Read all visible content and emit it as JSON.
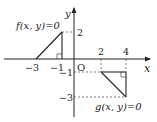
{
  "diagram": {
    "type": "coordinate-plane",
    "axes": {
      "x_label": "x",
      "y_label": "y",
      "origin_label": "O"
    },
    "x_ticks": [
      {
        "value": -3,
        "label": "−3"
      },
      {
        "value": -1,
        "label": "−1"
      },
      {
        "value": 2,
        "label": "2"
      },
      {
        "value": 4,
        "label": "4"
      }
    ],
    "y_ticks": [
      {
        "value": 2,
        "label": "2"
      },
      {
        "value": -1,
        "label": "−1"
      },
      {
        "value": -3,
        "label": "−3"
      }
    ],
    "regions": [
      {
        "name": "f",
        "label": "f(x, y)=0",
        "vertices": [
          [
            -3,
            0
          ],
          [
            -1,
            0
          ],
          [
            -1,
            2
          ]
        ],
        "right_angle_at": [
          -1,
          0
        ]
      },
      {
        "name": "g",
        "label": "g(x, y)=0",
        "vertices": [
          [
            2,
            -1
          ],
          [
            4,
            -1
          ],
          [
            4,
            -3
          ]
        ],
        "right_angle_at": [
          4,
          -1
        ]
      }
    ],
    "colors": {
      "line": "#222222",
      "dashed": "#444444"
    }
  }
}
